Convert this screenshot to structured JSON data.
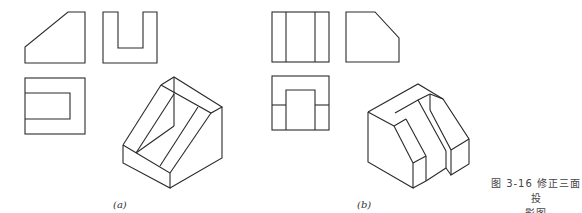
{
  "figure": {
    "number": "图 3-16",
    "caption_line1": "图 3-16  修正三面投",
    "caption_line2": "影图"
  },
  "subfigures": [
    {
      "id": "a",
      "label": "(a)",
      "views": [
        "front-view",
        "side-view",
        "top-view",
        "isometric-view"
      ]
    },
    {
      "id": "b",
      "label": "(b)",
      "views": [
        "front-view",
        "side-view",
        "top-view",
        "isometric-view"
      ]
    }
  ],
  "colors": {
    "line": "#2a2a2a",
    "background": "#ffffff"
  }
}
